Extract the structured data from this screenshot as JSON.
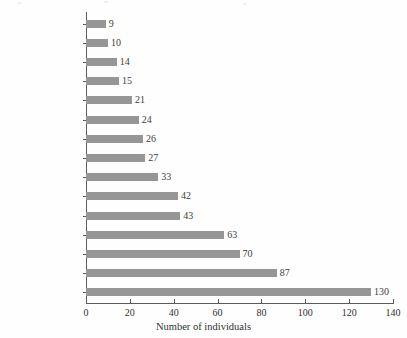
{
  "chart_data": {
    "type": "bar",
    "orientation": "horizontal",
    "title": "",
    "xlabel": "Number of individuals",
    "ylabel": "",
    "xlim": [
      0,
      140
    ],
    "xticks": [
      0,
      20,
      40,
      60,
      80,
      100,
      120,
      140
    ],
    "grid": false,
    "legend": null,
    "bar_color": "#969696",
    "highlight_category": "India",
    "categories": [
      "Lebanon",
      "Bosnia",
      "Gabon",
      "Colombia",
      "Portugal",
      "India",
      "Nigeria",
      "South Africa",
      "France",
      "Brazil",
      "United Kingdom",
      "China",
      "Germany",
      "Russia",
      "United States"
    ],
    "values": [
      9,
      10,
      14,
      15,
      21,
      24,
      26,
      27,
      33,
      42,
      43,
      63,
      70,
      87,
      130
    ],
    "data_labels": [
      "9",
      "10",
      "14",
      "15",
      "21",
      "24",
      "26",
      "27",
      "33",
      "42",
      "43",
      "63",
      "70",
      "87",
      "130"
    ],
    "bars": [
      {
        "label": "Lebanon",
        "value": 9,
        "display": "9",
        "bold": false
      },
      {
        "label": "Bosnia",
        "value": 10,
        "display": "10",
        "bold": false
      },
      {
        "label": "Gabon",
        "value": 14,
        "display": "14",
        "bold": false
      },
      {
        "label": "Colombia",
        "value": 15,
        "display": "15",
        "bold": false
      },
      {
        "label": "Portugal",
        "value": 21,
        "display": "21",
        "bold": false
      },
      {
        "label": "India",
        "value": 24,
        "display": "24",
        "bold": true
      },
      {
        "label": "Nigeria",
        "value": 26,
        "display": "26",
        "bold": false
      },
      {
        "label": "South Africa",
        "value": 27,
        "display": "27",
        "bold": false
      },
      {
        "label": "France",
        "value": 33,
        "display": "33",
        "bold": false
      },
      {
        "label": "Brazil",
        "value": 42,
        "display": "42",
        "bold": false
      },
      {
        "label": "United Kingdom",
        "value": 43,
        "display": "43",
        "bold": false
      },
      {
        "label": "China",
        "value": 63,
        "display": "63",
        "bold": false
      },
      {
        "label": "Germany",
        "value": 70,
        "display": "70",
        "bold": false
      },
      {
        "label": "Russia",
        "value": 87,
        "display": "87",
        "bold": false
      },
      {
        "label": "United States",
        "value": 130,
        "display": "130",
        "bold": false
      }
    ]
  }
}
